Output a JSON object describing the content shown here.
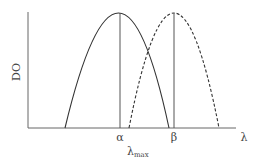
{
  "diagram": {
    "y_axis_label": "DO",
    "x_axis_label": "λ",
    "peak_labels": {
      "alpha": "α",
      "beta": "β"
    },
    "lambda_max": {
      "main": "λ",
      "sub": "max"
    },
    "curves": [
      {
        "name": "solid-absorption-curve",
        "style": "solid",
        "peak_label": "α"
      },
      {
        "name": "dashed-absorption-curve",
        "style": "dashed",
        "peak_label": "β"
      }
    ],
    "colors": {
      "line": "#3a3a3a",
      "axis": "#555555",
      "text": "#444444"
    }
  }
}
